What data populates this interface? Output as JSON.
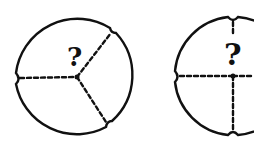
{
  "diagram": {
    "ink_color": "#111111",
    "background": "#ffffff",
    "figures": [
      {
        "name": "three-part-circle",
        "center_label": "?",
        "divisions": 3,
        "notches": [
          "left",
          "upper-right",
          "lower-right"
        ]
      },
      {
        "name": "four-part-circle",
        "center_label": "?",
        "divisions": 4,
        "notches": [
          "top",
          "left",
          "bottom",
          "right"
        ]
      }
    ]
  }
}
